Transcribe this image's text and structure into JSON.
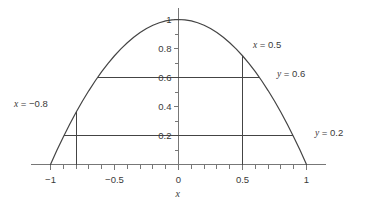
{
  "chart_data": {
    "type": "line",
    "title": "",
    "xlabel": "x",
    "ylabel": "",
    "xlim": [
      -1.15,
      1.15
    ],
    "ylim": [
      0,
      1.08
    ],
    "grid": false,
    "legend": null,
    "function": "y = 1 - x^2",
    "series": [
      {
        "name": "y = 1 - x^2",
        "color": "#444444",
        "x": [
          -1.0,
          -0.95,
          -0.9,
          -0.85,
          -0.8,
          -0.75,
          -0.7,
          -0.65,
          -0.6,
          -0.55,
          -0.5,
          -0.45,
          -0.4,
          -0.35,
          -0.3,
          -0.25,
          -0.2,
          -0.15,
          -0.1,
          -0.05,
          0.0,
          0.05,
          0.1,
          0.15,
          0.2,
          0.25,
          0.3,
          0.35,
          0.4,
          0.45,
          0.5,
          0.55,
          0.6,
          0.65,
          0.7,
          0.75,
          0.8,
          0.85,
          0.9,
          0.95,
          1.0
        ],
        "y": [
          0.0,
          0.0975,
          0.19,
          0.2775,
          0.36,
          0.4375,
          0.51,
          0.5775,
          0.64,
          0.6975,
          0.75,
          0.7975,
          0.84,
          0.8775,
          0.91,
          0.9375,
          0.96,
          0.9775,
          0.99,
          0.9975,
          1.0,
          0.9975,
          0.99,
          0.9775,
          0.96,
          0.9375,
          0.91,
          0.8775,
          0.84,
          0.7975,
          0.75,
          0.6975,
          0.64,
          0.5775,
          0.51,
          0.4375,
          0.36,
          0.2775,
          0.19,
          0.0975,
          0.0
        ]
      }
    ],
    "x_ticks_major": [
      -1,
      -0.5,
      0,
      0.5,
      1
    ],
    "x_tick_labels": [
      "-1",
      "-0.5",
      "0",
      "0.5",
      "1"
    ],
    "x_ticks_minor": [
      -0.9,
      -0.8,
      -0.7,
      -0.6,
      -0.4,
      -0.3,
      -0.2,
      -0.1,
      0.1,
      0.2,
      0.3,
      0.4,
      0.6,
      0.7,
      0.8,
      0.9
    ],
    "y_ticks_major": [
      0.2,
      0.4,
      0.6,
      0.8,
      1.0
    ],
    "y_tick_labels": [
      "0.2",
      "0.4",
      "0.6",
      "0.8",
      "1"
    ],
    "y_ticks_minor": [
      0.1,
      0.3,
      0.5,
      0.7,
      0.9
    ],
    "reference_lines": [
      {
        "id": "x-neg08",
        "orientation": "vertical",
        "value": -0.8,
        "label": "x = −0.8",
        "var": "x",
        "rhs": "= −0.8",
        "from_y": 0.0,
        "to_y": 0.36,
        "color": "#444444"
      },
      {
        "id": "x-05",
        "orientation": "vertical",
        "value": 0.5,
        "label": "x = 0.5",
        "var": "x",
        "rhs": "= 0.5",
        "from_y": 0.0,
        "to_y": 0.75,
        "color": "#444444"
      },
      {
        "id": "y-06",
        "orientation": "horizontal",
        "value": 0.6,
        "label": "y = 0.6",
        "var": "y",
        "rhs": "= 0.6",
        "from_x": -0.6325,
        "to_x": 0.6325,
        "color": "#444444"
      },
      {
        "id": "y-02",
        "orientation": "horizontal",
        "value": 0.2,
        "label": "y = 0.2",
        "var": "y",
        "rhs": "= 0.2",
        "from_x": -0.8944,
        "to_x": 0.8944,
        "color": "#444444"
      }
    ],
    "colors": {
      "curve": "#444444",
      "axis": "#777777",
      "reference": "#444444",
      "text": "#3a3a3a",
      "background": "#ffffff"
    }
  },
  "axes": {
    "x_axis_name": "x",
    "y_axis_name": ""
  }
}
